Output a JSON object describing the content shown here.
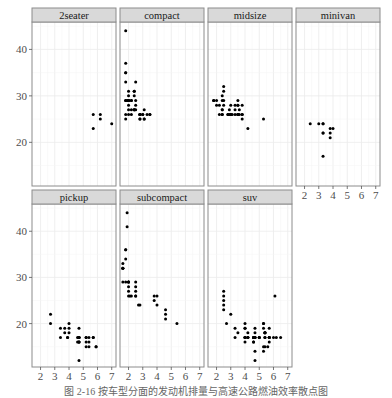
{
  "chart_data": {
    "type": "scatter",
    "title": "",
    "xlabel": "",
    "ylabel": "",
    "facet_by": "class",
    "facet_layout": {
      "ncol": 4,
      "nrow": 2
    },
    "xlim": [
      1.4,
      7.3
    ],
    "ylim": [
      10.6,
      45.9
    ],
    "x_ticks": [
      2,
      3,
      4,
      5,
      6,
      7
    ],
    "y_ticks": [
      20,
      30,
      40
    ],
    "grid": true,
    "point_color": "#000000",
    "strip_color": "#d9d9d9",
    "panels": [
      {
        "label": "2seater",
        "points": [
          [
            5.7,
            26
          ],
          [
            5.7,
            23
          ],
          [
            6.2,
            26
          ],
          [
            6.2,
            25
          ],
          [
            7.0,
            24
          ]
        ]
      },
      {
        "label": "compact",
        "points": [
          [
            1.8,
            29
          ],
          [
            1.8,
            29
          ],
          [
            2.0,
            31
          ],
          [
            2.0,
            30
          ],
          [
            2.8,
            26
          ],
          [
            2.8,
            26
          ],
          [
            3.1,
            27
          ],
          [
            1.8,
            26
          ],
          [
            1.8,
            25
          ],
          [
            2.0,
            28
          ],
          [
            2.0,
            27
          ],
          [
            2.8,
            25
          ],
          [
            2.8,
            25
          ],
          [
            3.1,
            25
          ],
          [
            3.1,
            25
          ],
          [
            2.2,
            26
          ],
          [
            2.2,
            29
          ],
          [
            2.4,
            27
          ],
          [
            2.4,
            31
          ],
          [
            3.0,
            26
          ],
          [
            3.3,
            26
          ],
          [
            1.8,
            33
          ],
          [
            1.8,
            35
          ],
          [
            1.8,
            37
          ],
          [
            1.8,
            35
          ],
          [
            1.8,
            44
          ],
          [
            1.9,
            29
          ],
          [
            2.0,
            26
          ],
          [
            2.0,
            29
          ],
          [
            2.0,
            29
          ],
          [
            2.0,
            29
          ],
          [
            2.0,
            29
          ],
          [
            2.5,
            28
          ],
          [
            2.5,
            29
          ],
          [
            2.8,
            26
          ],
          [
            2.8,
            26
          ],
          [
            2.4,
            27
          ],
          [
            2.4,
            30
          ],
          [
            2.5,
            33
          ],
          [
            2.5,
            27
          ],
          [
            3.5,
            26
          ],
          [
            3.5,
            26
          ],
          [
            2.2,
            27
          ],
          [
            2.2,
            29
          ],
          [
            2.4,
            27
          ],
          [
            2.4,
            31
          ],
          [
            3.0,
            26
          ]
        ]
      },
      {
        "label": "midsize",
        "points": [
          [
            2.4,
            27
          ],
          [
            2.4,
            30
          ],
          [
            3.1,
            26
          ],
          [
            3.5,
            29
          ],
          [
            3.6,
            26
          ],
          [
            2.4,
            26
          ],
          [
            3.0,
            26
          ],
          [
            3.3,
            28
          ],
          [
            3.3,
            26
          ],
          [
            3.3,
            27
          ],
          [
            3.8,
            28
          ],
          [
            3.8,
            26
          ],
          [
            3.8,
            26
          ],
          [
            3.8,
            25
          ],
          [
            5.3,
            25
          ],
          [
            2.5,
            28
          ],
          [
            2.5,
            29
          ],
          [
            2.5,
            31
          ],
          [
            2.5,
            32
          ],
          [
            2.9,
            27
          ],
          [
            2.9,
            26
          ],
          [
            3.5,
            26
          ],
          [
            3.5,
            28
          ],
          [
            1.8,
            29
          ],
          [
            1.8,
            29
          ],
          [
            2.0,
            28
          ],
          [
            2.0,
            29
          ],
          [
            2.8,
            26
          ],
          [
            2.8,
            26
          ],
          [
            3.6,
            27
          ],
          [
            4.2,
            23
          ],
          [
            2.4,
            26
          ],
          [
            2.4,
            29
          ],
          [
            3.0,
            28
          ],
          [
            3.0,
            26
          ],
          [
            3.5,
            26
          ],
          [
            3.5,
            26
          ],
          [
            3.5,
            28
          ],
          [
            2.2,
            28
          ],
          [
            2.2,
            26
          ],
          [
            2.4,
            27
          ]
        ]
      },
      {
        "label": "minivan",
        "points": [
          [
            2.4,
            24
          ],
          [
            3.0,
            24
          ],
          [
            3.3,
            22
          ],
          [
            3.3,
            22
          ],
          [
            3.3,
            24
          ],
          [
            3.3,
            24
          ],
          [
            3.3,
            17
          ],
          [
            3.8,
            22
          ],
          [
            3.8,
            21
          ],
          [
            3.8,
            23
          ],
          [
            4.0,
            23
          ]
        ]
      },
      {
        "label": "pickup",
        "points": [
          [
            2.7,
            20
          ],
          [
            2.7,
            22
          ],
          [
            3.4,
            19
          ],
          [
            3.4,
            17
          ],
          [
            4.0,
            18
          ],
          [
            4.7,
            17
          ],
          [
            4.7,
            12
          ],
          [
            4.7,
            17
          ],
          [
            5.2,
            16
          ],
          [
            5.7,
            17
          ],
          [
            5.9,
            15
          ],
          [
            4.7,
            17
          ],
          [
            4.7,
            17
          ],
          [
            4.7,
            16
          ],
          [
            5.2,
            17
          ],
          [
            5.2,
            15
          ],
          [
            3.7,
            19
          ],
          [
            3.7,
            18
          ],
          [
            3.9,
            17
          ],
          [
            3.9,
            17
          ],
          [
            4.7,
            16
          ],
          [
            4.7,
            16
          ],
          [
            4.7,
            19
          ],
          [
            5.2,
            17
          ],
          [
            5.7,
            17
          ],
          [
            5.9,
            15
          ],
          [
            4.6,
            17
          ],
          [
            5.4,
            15
          ],
          [
            5.4,
            16
          ],
          [
            4.0,
            20
          ],
          [
            4.0,
            19
          ],
          [
            4.6,
            16
          ],
          [
            5.4,
            17
          ]
        ]
      },
      {
        "label": "subcompact",
        "points": [
          [
            3.8,
            26
          ],
          [
            3.8,
            25
          ],
          [
            4.0,
            26
          ],
          [
            4.0,
            24
          ],
          [
            4.6,
            21
          ],
          [
            4.6,
            22
          ],
          [
            4.6,
            23
          ],
          [
            5.4,
            20
          ],
          [
            1.6,
            33
          ],
          [
            1.6,
            32
          ],
          [
            1.6,
            32
          ],
          [
            1.6,
            29
          ],
          [
            1.6,
            32
          ],
          [
            1.8,
            34
          ],
          [
            1.8,
            36
          ],
          [
            1.8,
            36
          ],
          [
            2.0,
            29
          ],
          [
            2.0,
            26
          ],
          [
            2.0,
            27
          ],
          [
            2.0,
            28
          ],
          [
            2.0,
            29
          ],
          [
            2.5,
            26
          ],
          [
            2.5,
            27
          ],
          [
            2.5,
            28
          ],
          [
            2.5,
            29
          ],
          [
            2.2,
            26
          ],
          [
            2.5,
            26
          ],
          [
            2.7,
            24
          ],
          [
            1.9,
            44
          ],
          [
            1.9,
            41
          ],
          [
            2.0,
            29
          ],
          [
            2.1,
            26
          ],
          [
            2.8,
            24
          ],
          [
            1.8,
            29
          ]
        ]
      },
      {
        "label": "suv",
        "points": [
          [
            5.3,
            20
          ],
          [
            5.3,
            15
          ],
          [
            5.3,
            20
          ],
          [
            5.7,
            17
          ],
          [
            6.0,
            17
          ],
          [
            5.7,
            17
          ],
          [
            5.7,
            17
          ],
          [
            6.2,
            17
          ],
          [
            6.1,
            26
          ],
          [
            6.5,
            17
          ],
          [
            5.3,
            19
          ],
          [
            5.3,
            14
          ],
          [
            4.7,
            17
          ],
          [
            4.7,
            12
          ],
          [
            5.7,
            19
          ],
          [
            4.0,
            17
          ],
          [
            4.0,
            19
          ],
          [
            4.6,
            17
          ],
          [
            5.0,
            17
          ],
          [
            4.2,
            17
          ],
          [
            4.2,
            17
          ],
          [
            4.6,
            16
          ],
          [
            5.4,
            18
          ],
          [
            5.4,
            17
          ],
          [
            4.7,
            19
          ],
          [
            4.7,
            14
          ],
          [
            5.6,
            15
          ],
          [
            4.7,
            18
          ],
          [
            4.7,
            17
          ],
          [
            5.4,
            15
          ],
          [
            2.5,
            23
          ],
          [
            2.5,
            24
          ],
          [
            2.5,
            25
          ],
          [
            2.5,
            26
          ],
          [
            2.5,
            27
          ],
          [
            2.7,
            20
          ],
          [
            3.3,
            17
          ],
          [
            3.3,
            19
          ],
          [
            4.0,
            17
          ],
          [
            4.0,
            20
          ],
          [
            3.0,
            22
          ],
          [
            4.0,
            17
          ],
          [
            4.0,
            16
          ],
          [
            4.0,
            19
          ],
          [
            4.6,
            17
          ],
          [
            4.6,
            16
          ],
          [
            5.0,
            17
          ],
          [
            5.0,
            17
          ],
          [
            5.7,
            16
          ],
          [
            5.7,
            17
          ],
          [
            5.4,
            18
          ],
          [
            5.4,
            18
          ],
          [
            4.2,
            18
          ],
          [
            4.2,
            17
          ],
          [
            4.6,
            17
          ],
          [
            4.6,
            17
          ],
          [
            5.4,
            18
          ],
          [
            5.4,
            17
          ],
          [
            4.7,
            17
          ],
          [
            3.5,
            18
          ]
        ]
      }
    ]
  },
  "caption": "图 2-16  按车型分面的发动机排量与高速公路燃油效率散点图"
}
